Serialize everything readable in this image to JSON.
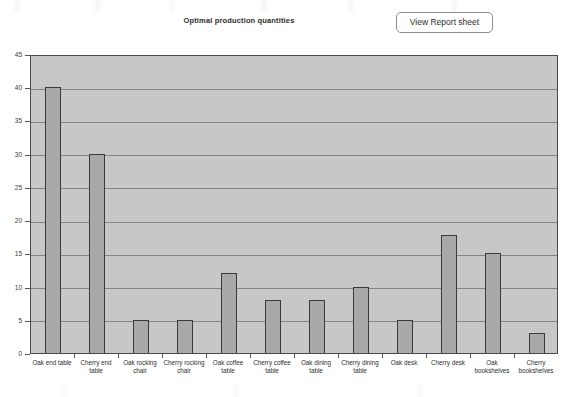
{
  "header": {
    "title": "Optimal production quantities",
    "view_report_button_label": "View Report sheet"
  },
  "chart_data": {
    "type": "bar",
    "title": "Optimal production quantities",
    "xlabel": "",
    "ylabel": "",
    "ylim": [
      0,
      45
    ],
    "ytick_labels": [
      "0",
      "5",
      "10",
      "15",
      "20",
      "25",
      "30",
      "35",
      "40",
      "45"
    ],
    "ytick_values": [
      0,
      5,
      10,
      15,
      20,
      25,
      30,
      35,
      40,
      45
    ],
    "grid": true,
    "legend": "none",
    "bar_fill_color": "#a9a9a9",
    "bar_border_color": "#3b3b3b",
    "plot_background_color": "#c7c7c7",
    "categories": [
      "Oak end table",
      "Cherry end table",
      "Oak rocking chair",
      "Cherry rocking chair",
      "Oak coffee table",
      "Cherry coffee table",
      "Oak dining table",
      "Cherry dining table",
      "Oak desk",
      "Cherry desk",
      "Oak bookshelves",
      "Cherry bookshelves"
    ],
    "values": [
      40,
      30,
      5,
      5,
      12,
      8,
      8,
      10,
      5,
      17.8,
      15,
      3
    ]
  }
}
